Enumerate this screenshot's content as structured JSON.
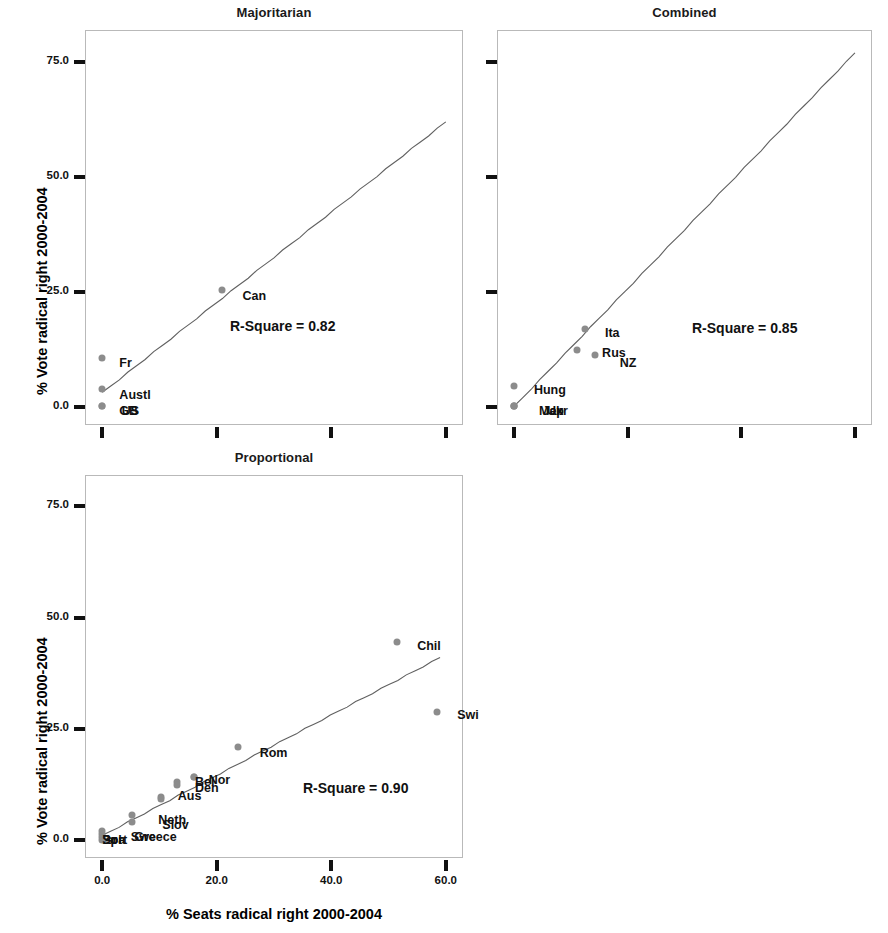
{
  "figure": {
    "axis_labels": {
      "y": "% Vote radical right 2000-2004",
      "x": "% Seats radical right 2000-2004"
    }
  },
  "chart_data": {
    "type": "scatter",
    "title": "",
    "xlabel": "% Seats radical right 2000-2004",
    "ylabel": "% Vote radical right 2000-2004",
    "xlim": [
      -3,
      63
    ],
    "ylim": [
      -4,
      82
    ],
    "grid": false,
    "legend": "none",
    "shared_yticks": [
      "0.0",
      "25.0",
      "50.0",
      "75.0"
    ],
    "shared_ytickvals": [
      0,
      25,
      50,
      75
    ],
    "shared_xticks": [
      "0.0",
      "20.0",
      "40.0",
      "60.0"
    ],
    "shared_xtickvals": [
      0,
      20,
      40,
      60
    ],
    "panels": [
      {
        "id": "majoritarian",
        "title": "Majoritarian",
        "rsquare_label": "R-Square = 0.82",
        "rsquare": 0.82,
        "show_ytick_labels": true,
        "show_xtick_labels": false,
        "fit_line": {
          "x0": 0,
          "y0": 3.0,
          "x1": 60,
          "y1": 62.0
        },
        "points": [
          {
            "label": "Can",
            "x": 21.0,
            "y": 25.5,
            "lx": 24.5,
            "ly": 24.0
          },
          {
            "label": "Fr",
            "x": 0.0,
            "y": 10.5,
            "lx": 3.0,
            "ly": 9.5
          },
          {
            "label": "Austl",
            "x": 0.0,
            "y": 3.8,
            "lx": 3.0,
            "ly": 2.6
          },
          {
            "label": "GB",
            "x": 0.0,
            "y": 0.2,
            "lx": 3.0,
            "ly": -0.9
          },
          {
            "label": "US",
            "x": 0.0,
            "y": 0.2,
            "lx": 3.4,
            "ly": -0.9
          }
        ]
      },
      {
        "id": "combined",
        "title": "Combined",
        "rsquare_label": "R-Square = 0.85",
        "rsquare": 0.85,
        "show_ytick_labels": false,
        "show_xtick_labels": false,
        "fit_line": {
          "x0": 0,
          "y0": 0.0,
          "x1": 60,
          "y1": 77.0
        },
        "points": [
          {
            "label": "Ita",
            "x": 12.5,
            "y": 17.0,
            "lx": 16.0,
            "ly": 16.0
          },
          {
            "label": "Rus",
            "x": 11.0,
            "y": 12.4,
            "lx": 15.5,
            "ly": 11.6
          },
          {
            "label": "NZ",
            "x": 14.2,
            "y": 11.2,
            "lx": 18.6,
            "ly": 9.6
          },
          {
            "label": "Hung",
            "x": 0.0,
            "y": 4.6,
            "lx": 3.5,
            "ly": 3.6
          },
          {
            "label": "Mex",
            "x": 0.0,
            "y": 0.2,
            "lx": 4.4,
            "ly": -1.0
          },
          {
            "label": "Jap",
            "x": 0.0,
            "y": 0.2,
            "lx": 5.0,
            "ly": -1.0
          },
          {
            "label": "Ukr",
            "x": 0.0,
            "y": 0.2,
            "lx": 5.8,
            "ly": -1.0
          }
        ]
      },
      {
        "id": "proportional",
        "title": "Proportional",
        "rsquare_label": "R-Square = 0.90",
        "rsquare": 0.9,
        "show_ytick_labels": true,
        "show_xtick_labels": true,
        "fit_line": {
          "x0": 0,
          "y0": 1.0,
          "x1": 59,
          "y1": 41.0
        },
        "points": [
          {
            "label": "Chil",
            "x": 51.5,
            "y": 44.5,
            "lx": 55.0,
            "ly": 43.5
          },
          {
            "label": "Swi",
            "x": 58.5,
            "y": 28.8,
            "lx": 62.0,
            "ly": 28.0
          },
          {
            "label": "Rom",
            "x": 23.8,
            "y": 21.0,
            "lx": 27.5,
            "ly": 19.6
          },
          {
            "label": "Nor",
            "x": 16.0,
            "y": 14.2,
            "lx": 18.6,
            "ly": 13.5
          },
          {
            "label": "Bel",
            "x": 16.0,
            "y": 14.2,
            "lx": 16.2,
            "ly": 13.0
          },
          {
            "label": "Den",
            "x": 13.0,
            "y": 13.0,
            "lx": 16.2,
            "ly": 11.7
          },
          {
            "label": "Aus",
            "x": 13.0,
            "y": 12.5,
            "lx": 13.2,
            "ly": 9.9
          },
          {
            "label": "Neth",
            "x": 10.3,
            "y": 9.6,
            "lx": 9.8,
            "ly": 4.6
          },
          {
            "label": "Slov",
            "x": 10.3,
            "y": 9.2,
            "lx": 10.5,
            "ly": 3.3
          },
          {
            "label": "Swe",
            "x": 5.2,
            "y": 5.6,
            "lx": 5.0,
            "ly": 0.7
          },
          {
            "label": "Greece",
            "x": 5.2,
            "y": 4.1,
            "lx": 5.6,
            "ly": 0.7
          },
          {
            "label": "Isr",
            "x": 0.0,
            "y": 2.1,
            "lx": 0.0,
            "ly": 0.0
          },
          {
            "label": "Pol",
            "x": 0.0,
            "y": 1.4,
            "lx": 0.0,
            "ly": 0.0
          },
          {
            "label": "Port",
            "x": 0.0,
            "y": 0.7,
            "lx": 0.0,
            "ly": 0.0
          },
          {
            "label": "Spa",
            "x": 0.0,
            "y": 0.1,
            "lx": 0.0,
            "ly": 0.0
          }
        ]
      }
    ]
  }
}
